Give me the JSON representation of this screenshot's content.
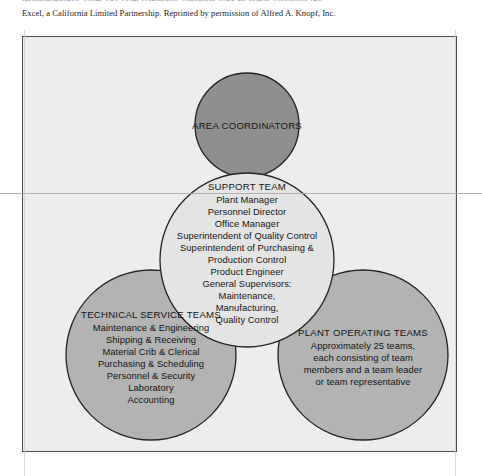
{
  "caption": {
    "clipped_line": "interdependence. From The Team Handbook, copyright 1988 by Joiner Associates Inc.",
    "line": "Excel, a California Limited Partnership. Reprinted by permission of Alfred A. Knopf, Inc."
  },
  "figure": {
    "type": "venn-organizational-diagram",
    "frame_color": "#4c4c4c",
    "background_color": "#ededed",
    "circles": [
      {
        "id": "area-coordinators",
        "title": "AREA COORDINATORS",
        "items": [],
        "fill": "#8f8f8f",
        "cx": 224,
        "cy": 88,
        "r": 52,
        "position": "top"
      },
      {
        "id": "support-team",
        "title": "SUPPORT TEAM",
        "items": [
          "Plant Manager",
          "Personnel Director",
          "Office Manager",
          "Superintendent of Quality Control",
          "Superintendent of Purchasing &",
          "Production Control",
          "Product Engineer",
          "General Supervisors:",
          "Maintenance,",
          "Manufacturing,",
          "Quality Control"
        ],
        "fill": "#e4e4e4",
        "cx": 224,
        "cy": 223,
        "r": 87,
        "position": "center"
      },
      {
        "id": "technical-service-teams",
        "title": "TECHNICAL SERVICE TEAMS",
        "items": [
          "Maintenance & Engineering",
          "Shipping & Receiving",
          "Material Crib & Clerical",
          "Purchasing & Scheduling",
          "Personnel & Security",
          "Laboratory",
          "Accounting"
        ],
        "fill": "#b3b3b3",
        "cx": 128,
        "cy": 318,
        "r": 85,
        "position": "bottom-left"
      },
      {
        "id": "plant-operating-teams",
        "title": "PLANT OPERATING TEAMS",
        "items": [
          "Approximately 25 teams,",
          "each consisting of team",
          "members and a team leader",
          "or team representative"
        ],
        "fill": "#b3b3b3",
        "cx": 340,
        "cy": 318,
        "r": 85,
        "position": "bottom-right"
      }
    ]
  }
}
